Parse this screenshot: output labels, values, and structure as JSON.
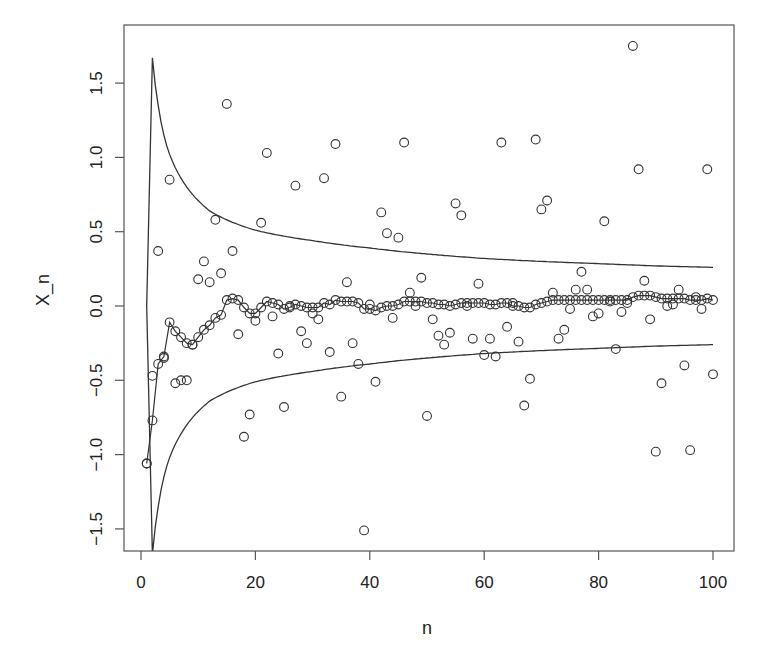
{
  "chart_data": {
    "type": "scatter",
    "title": "",
    "xlabel": "n",
    "ylabel": "X_n",
    "xlim": [
      -2.5,
      103.5
    ],
    "ylim": [
      -1.65,
      1.88
    ],
    "x_ticks": [
      0,
      20,
      40,
      60,
      80,
      100
    ],
    "x_tick_labels": [
      "0",
      "20",
      "40",
      "60",
      "80",
      "100"
    ],
    "y_ticks": [
      -1.5,
      -1.0,
      -0.5,
      0.0,
      0.5,
      1.0,
      1.5
    ],
    "y_tick_labels": [
      "−1.5",
      "−1.0",
      "−0.5",
      "0.0",
      "0.5",
      "1.0",
      "1.5"
    ],
    "grid": false,
    "legend": null,
    "series": [
      {
        "name": "X_n",
        "style": "points-open-circle",
        "x": [
          1,
          2,
          3,
          4,
          5,
          6,
          7,
          8,
          9,
          10,
          11,
          12,
          13,
          14,
          15,
          16,
          17,
          18,
          19,
          20,
          21,
          22,
          23,
          24,
          25,
          26,
          27,
          28,
          29,
          30,
          31,
          32,
          33,
          34,
          35,
          36,
          37,
          38,
          39,
          40,
          41,
          42,
          43,
          44,
          45,
          46,
          47,
          48,
          49,
          50,
          51,
          52,
          53,
          54,
          55,
          56,
          57,
          58,
          59,
          60,
          61,
          62,
          63,
          64,
          65,
          66,
          67,
          68,
          69,
          70,
          71,
          72,
          73,
          74,
          75,
          76,
          77,
          78,
          79,
          80,
          81,
          82,
          83,
          84,
          85,
          86,
          87,
          88,
          89,
          90,
          91,
          92,
          93,
          94,
          95,
          96,
          97,
          98,
          99,
          100
        ],
        "values": [
          -1.06,
          -0.47,
          0.37,
          -0.35,
          0.85,
          -0.52,
          -0.5,
          -0.5,
          -0.26,
          0.18,
          0.3,
          0.16,
          0.58,
          0.22,
          1.36,
          0.37,
          -0.19,
          -0.88,
          -0.73,
          -0.1,
          0.56,
          1.03,
          -0.07,
          -0.32,
          -0.68,
          0.0,
          0.81,
          -0.17,
          -0.25,
          -0.05,
          -0.09,
          0.86,
          -0.31,
          1.09,
          -0.61,
          0.16,
          -0.25,
          -0.39,
          -1.51,
          0.01,
          -0.51,
          0.63,
          0.49,
          -0.08,
          0.46,
          1.1,
          0.09,
          0.0,
          0.19,
          -0.74,
          -0.09,
          -0.2,
          -0.26,
          -0.18,
          0.69,
          0.61,
          0.0,
          -0.22,
          0.15,
          -0.33,
          -0.22,
          -0.34,
          1.1,
          -0.14,
          0.02,
          -0.24,
          -0.67,
          -0.49,
          1.12,
          0.65,
          0.71,
          0.09,
          -0.22,
          -0.16,
          -0.02,
          0.11,
          0.23,
          0.11,
          -0.07,
          -0.05,
          0.57,
          0.03,
          -0.29,
          -0.04,
          0.02,
          1.75,
          0.92,
          0.17,
          -0.09,
          -0.98,
          -0.52,
          0.0,
          0.01,
          0.11,
          -0.4,
          -0.97,
          0.06,
          -0.02,
          0.92,
          -0.46
        ]
      },
      {
        "name": "running mean",
        "style": "line-with-open-circles",
        "x": [
          1,
          2,
          3,
          4,
          5,
          6,
          7,
          8,
          9,
          10,
          11,
          12,
          13,
          14,
          15,
          16,
          17,
          18,
          19,
          20,
          21,
          22,
          23,
          24,
          25,
          26,
          27,
          28,
          29,
          30,
          31,
          32,
          33,
          34,
          35,
          36,
          37,
          38,
          39,
          40,
          41,
          42,
          43,
          44,
          45,
          46,
          47,
          48,
          49,
          50,
          51,
          52,
          53,
          54,
          55,
          56,
          57,
          58,
          59,
          60,
          61,
          62,
          63,
          64,
          65,
          66,
          67,
          68,
          69,
          70,
          71,
          72,
          73,
          74,
          75,
          76,
          77,
          78,
          79,
          80,
          81,
          82,
          83,
          84,
          85,
          86,
          87,
          88,
          89,
          90,
          91,
          92,
          93,
          94,
          95,
          96,
          97,
          98,
          99,
          100
        ],
        "values": [
          -1.06,
          -0.77,
          -0.39,
          -0.34,
          -0.11,
          -0.17,
          -0.21,
          -0.25,
          -0.26,
          -0.21,
          -0.16,
          -0.13,
          -0.08,
          -0.06,
          0.04,
          0.05,
          0.04,
          -0.01,
          -0.05,
          -0.05,
          -0.01,
          0.03,
          0.02,
          0.01,
          -0.02,
          -0.01,
          0.01,
          0.0,
          -0.01,
          -0.01,
          -0.01,
          0.02,
          0.01,
          0.04,
          0.03,
          0.03,
          0.03,
          0.02,
          -0.02,
          -0.02,
          -0.03,
          -0.01,
          0.0,
          0.0,
          0.01,
          0.03,
          0.03,
          0.03,
          0.03,
          0.02,
          0.02,
          0.01,
          0.01,
          0.0,
          0.01,
          0.02,
          0.02,
          0.02,
          0.02,
          0.02,
          0.01,
          0.01,
          0.02,
          0.02,
          0.0,
          0.0,
          -0.01,
          -0.01,
          0.01,
          0.02,
          0.03,
          0.04,
          0.04,
          0.04,
          0.04,
          0.04,
          0.04,
          0.04,
          0.04,
          0.04,
          0.04,
          0.04,
          0.04,
          0.04,
          0.04,
          0.06,
          0.07,
          0.07,
          0.07,
          0.06,
          0.05,
          0.05,
          0.05,
          0.05,
          0.05,
          0.04,
          0.04,
          0.04,
          0.05,
          0.04
        ]
      },
      {
        "name": "upper envelope",
        "style": "line",
        "x": [
          1,
          2,
          3,
          4,
          5,
          6,
          7,
          8,
          10,
          12,
          15,
          20,
          25,
          30,
          40,
          50,
          60,
          70,
          80,
          90,
          100
        ],
        "values": [
          0.0,
          1.67,
          1.35,
          1.15,
          1.02,
          0.93,
          0.86,
          0.8,
          0.71,
          0.64,
          0.58,
          0.51,
          0.47,
          0.44,
          0.39,
          0.35,
          0.32,
          0.3,
          0.285,
          0.27,
          0.26
        ]
      },
      {
        "name": "lower envelope",
        "style": "line",
        "x": [
          1,
          2,
          3,
          4,
          5,
          6,
          7,
          8,
          10,
          12,
          15,
          20,
          25,
          30,
          40,
          50,
          60,
          70,
          80,
          90,
          100
        ],
        "values": [
          0.0,
          -1.67,
          -1.35,
          -1.15,
          -1.02,
          -0.93,
          -0.86,
          -0.8,
          -0.71,
          -0.64,
          -0.58,
          -0.51,
          -0.47,
          -0.44,
          -0.39,
          -0.35,
          -0.32,
          -0.3,
          -0.285,
          -0.27,
          -0.26
        ]
      }
    ],
    "colors": {
      "ink": "#333333",
      "background": "#ffffff"
    }
  }
}
